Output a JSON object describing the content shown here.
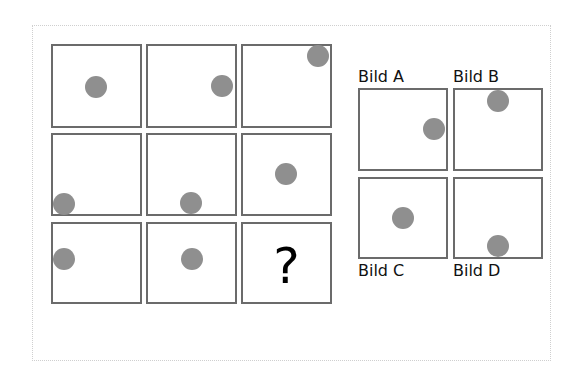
{
  "puzzle": {
    "question_mark": "?",
    "colors": {
      "cell_border": "#6b6b6b",
      "dot": "#8f8f8f",
      "frame_border": "#cfcfcf",
      "text": "#111111"
    },
    "grid": [
      {
        "row": 1,
        "col": 1,
        "dot": {
          "x": 96,
          "y": 87
        }
      },
      {
        "row": 1,
        "col": 2,
        "dot": {
          "x": 222,
          "y": 86
        }
      },
      {
        "row": 1,
        "col": 3,
        "dot": {
          "x": 318,
          "y": 56
        }
      },
      {
        "row": 2,
        "col": 1,
        "dot": {
          "x": 64,
          "y": 204
        }
      },
      {
        "row": 2,
        "col": 2,
        "dot": {
          "x": 191,
          "y": 203
        }
      },
      {
        "row": 2,
        "col": 3,
        "dot": {
          "x": 286,
          "y": 174
        }
      },
      {
        "row": 3,
        "col": 1,
        "dot": {
          "x": 64,
          "y": 259
        }
      },
      {
        "row": 3,
        "col": 2,
        "dot": {
          "x": 192,
          "y": 259
        }
      },
      {
        "row": 3,
        "col": 3,
        "dot": null
      }
    ],
    "options": [
      {
        "label": "Bild A"
      },
      {
        "label": "Bild B"
      },
      {
        "label": "Bild C"
      },
      {
        "label": "Bild D"
      }
    ]
  }
}
